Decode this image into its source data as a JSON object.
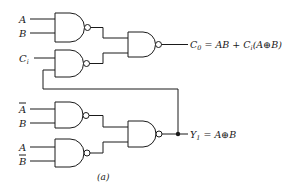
{
  "diagram": {
    "type": "logic-circuit",
    "caption": "(a)",
    "inputs": {
      "gate1": [
        "A",
        "B"
      ],
      "gate2": [
        "C",
        "i"
      ],
      "gate4": [
        "A",
        "B"
      ],
      "gate5": [
        "A",
        "B"
      ]
    },
    "labels": {
      "a1": "A",
      "b1": "B",
      "ci_main": "C",
      "ci_sub": "i",
      "a_bar": "A",
      "b4": "B",
      "a5": "A",
      "b_bar": "B"
    },
    "outputs": {
      "c0": {
        "var": "C",
        "sub": "0",
        "expr_part1": " = AB + C",
        "expr_sub": "i",
        "expr_part2": "(A",
        "xor": "⊕",
        "expr_part3": "B)"
      },
      "y1": {
        "var": "Y",
        "sub": "1",
        "expr_part1": " = A",
        "xor": "⊕",
        "expr_part2": "B"
      }
    },
    "gates": [
      {
        "id": "gate1",
        "type": "NAND",
        "inputs": [
          "A",
          "B"
        ]
      },
      {
        "id": "gate2",
        "type": "NAND",
        "inputs": [
          "Ci",
          "Y1 (feedback)"
        ]
      },
      {
        "id": "gate3",
        "type": "NAND",
        "inputs": [
          "gate1",
          "gate2"
        ],
        "output": "C0 = AB + Ci(A⊕B)"
      },
      {
        "id": "gate4",
        "type": "NAND",
        "inputs": [
          "Ā",
          "B"
        ]
      },
      {
        "id": "gate5",
        "type": "NAND",
        "inputs": [
          "A",
          "B̄"
        ]
      },
      {
        "id": "gate6",
        "type": "NAND",
        "inputs": [
          "gate4",
          "gate5"
        ],
        "output": "Y1 = A⊕B"
      }
    ]
  }
}
